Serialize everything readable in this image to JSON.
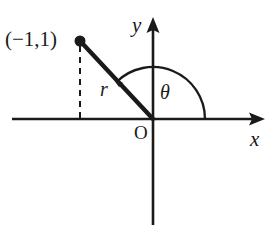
{
  "figure": {
    "type": "polar-coordinate-diagram",
    "background_color": "#ffffff",
    "stroke_color": "#1a1a1a",
    "labels": {
      "point": "(−1,1)",
      "y_axis": "y",
      "x_axis": "x",
      "origin": "O",
      "angle": "θ",
      "radius": "r"
    },
    "geometry": {
      "origin_px": [
        153,
        119
      ],
      "point_px": [
        80,
        41
      ],
      "point_coordinates": [
        -1,
        1
      ],
      "x_axis_from_px": [
        12,
        119
      ],
      "x_axis_to_px": [
        265,
        119
      ],
      "y_axis_from_px": [
        153,
        225
      ],
      "y_axis_to_px": [
        153,
        18
      ],
      "arc_radius_px": 52,
      "arc_start_deg": 0,
      "arc_end_deg": 135,
      "dashed_drop_from_px": [
        80,
        45
      ],
      "dashed_drop_to_px": [
        80,
        119
      ],
      "point_dot_radius_px": 5.5,
      "arrowheads": [
        "x-axis-right",
        "y-axis-up",
        "angle-arc-end"
      ]
    }
  }
}
